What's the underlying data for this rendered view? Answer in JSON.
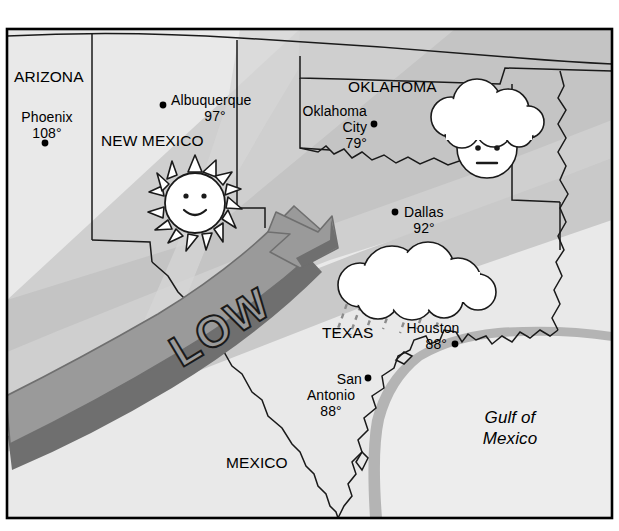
{
  "map": {
    "title": "Regional weather map of the southwestern United States",
    "frame": {
      "border_color": "#000000"
    },
    "palette": {
      "land_light": "#e9e9e9",
      "land_mid": "#cfcfcf",
      "land_dark": "#bcbcbc",
      "water": "#ededed",
      "coastal_band": "#b4b4b4",
      "arrow_fill": "#9a9a9a",
      "arrow_shadow": "#6f6f6f",
      "cloud_fill": "#ffffff",
      "outline": "#1a1a1a",
      "rain": "#8c8c8c",
      "background": "#ffffff"
    },
    "states": [
      {
        "name": "ARIZONA",
        "label": "ARIZONA"
      },
      {
        "name": "NEW MEXICO",
        "label": "NEW MEXICO"
      },
      {
        "name": "OKLAHOMA",
        "label": "OKLAHOMA"
      },
      {
        "name": "TEXAS",
        "label": "TEXAS"
      }
    ],
    "countries": [
      {
        "name": "MEXICO",
        "label": "MEXICO"
      }
    ],
    "water_bodies": [
      {
        "name": "Gulf of Mexico",
        "line1": "Gulf of",
        "line2": "Mexico"
      }
    ],
    "cities": [
      {
        "name": "Phoenix",
        "label": "Phoenix",
        "temperature": "108°"
      },
      {
        "name": "Albuquerque",
        "label": "Albuquerque",
        "temperature": "97°"
      },
      {
        "name": "Oklahoma City",
        "label_line1": "Oklahoma",
        "label_line2": "City",
        "temperature": "79°"
      },
      {
        "name": "Dallas",
        "label": "Dallas",
        "temperature": "92°"
      },
      {
        "name": "Houston",
        "label": "Houston",
        "temperature": "88°"
      },
      {
        "name": "San Antonio",
        "label_line1": "San",
        "label_line2": "Antonio",
        "temperature": "88°"
      }
    ],
    "weather_symbols": [
      {
        "type": "sun",
        "name": "sunny-face",
        "location": "New Mexico",
        "expression": "smiling"
      },
      {
        "type": "sun-behind-cloud",
        "name": "partly-cloudy-face",
        "location": "Oklahoma",
        "expression": "neutral"
      },
      {
        "type": "rain-cloud",
        "name": "rain-cloud",
        "location": "Texas",
        "expression": "none"
      }
    ],
    "pressure_systems": [
      {
        "type": "low",
        "label": "LOW",
        "arrow_direction": "northeast"
      }
    ]
  }
}
